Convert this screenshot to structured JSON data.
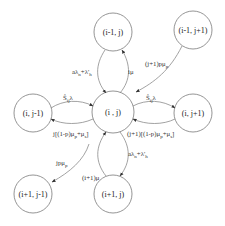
{
  "diagram": {
    "type": "state-transition",
    "nodes": [
      {
        "id": "center",
        "label": "(i , j)",
        "cx": 113,
        "cy": 112,
        "r": 21
      },
      {
        "id": "up",
        "label": "(i-1, j)",
        "cx": 113,
        "cy": 32,
        "r": 19
      },
      {
        "id": "up_right",
        "label": "(i-1, j+1)",
        "cx": 193,
        "cy": 30,
        "r": 19
      },
      {
        "id": "left",
        "label": "(i, j-1)",
        "cx": 33,
        "cy": 113,
        "r": 19
      },
      {
        "id": "right",
        "label": "(i, j+1)",
        "cx": 193,
        "cy": 113,
        "r": 19
      },
      {
        "id": "down_left",
        "label": "(i+1, j-1)",
        "cx": 33,
        "cy": 194,
        "r": 19
      },
      {
        "id": "down",
        "label": "(i+1, j)",
        "cx": 113,
        "cy": 194,
        "r": 19
      }
    ],
    "edges": [
      {
        "from": "up",
        "to": "center",
        "label": "aλn+λ'h",
        "parts": [
          [
            "a",
            ""
          ],
          [
            "λ",
            ""
          ],
          [
            "n",
            "sub"
          ],
          [
            "+λ'",
            ""
          ],
          [
            "h",
            "sub"
          ]
        ]
      },
      {
        "from": "center",
        "to": "up",
        "label": "iμ"
      },
      {
        "from": "up_right",
        "to": "center",
        "label": "(j+1)pμp"
      },
      {
        "from": "left",
        "to": "center",
        "label": "Ŝijλ"
      },
      {
        "from": "center",
        "to": "left",
        "label": "j[(1-p)μp+μs]"
      },
      {
        "from": "center",
        "to": "right",
        "label": "Ŝijλ"
      },
      {
        "from": "right",
        "to": "center",
        "label": "(j+1)[(1-p)μp+μs]"
      },
      {
        "from": "center",
        "to": "down_left",
        "label": "jpμp"
      },
      {
        "from": "down",
        "to": "center",
        "label": "(i+1)μ"
      },
      {
        "from": "center",
        "to": "down",
        "label": "aλn+λ'h"
      }
    ]
  },
  "labels": {
    "node_center": "(i , j)",
    "node_up": "(i-1, j)",
    "node_up_right": "(i-1, j+1)",
    "node_left": "(i, j-1)",
    "node_right": "(i, j+1)",
    "node_down_left": "(i+1, j-1)",
    "node_down": "(i+1, j)",
    "edge_up_to_center": {
      "a": "aλ",
      "b": "n",
      "c": "+λ'",
      "d": "h"
    },
    "edge_center_to_up": "iμ",
    "edge_up_right_to_center": {
      "a": "(j+1)pμ",
      "b": "p"
    },
    "edge_left_to_center": {
      "a": "Ŝ",
      "b": "ij",
      "c": "λ"
    },
    "edge_center_to_left": {
      "a": "j[(1-p)μ",
      "b": "p",
      "c": "+μ",
      "d": "s",
      "e": "]"
    },
    "edge_center_to_right": {
      "a": "Ŝ",
      "b": "ij",
      "c": "λ"
    },
    "edge_right_to_center": {
      "a": "(j+1)[(1-p)μ",
      "b": "p",
      "c": "+μ",
      "d": "s",
      "e": "]"
    },
    "edge_center_to_down_left": {
      "a": "jpμ",
      "b": "p"
    },
    "edge_down_to_center": "(i+1)μ",
    "edge_center_to_down": {
      "a": "aλ",
      "b": "n",
      "c": "+λ'",
      "d": "h"
    }
  },
  "colors": {
    "node_stroke": "#7a7a7a",
    "edge_stroke": "#8a8a8a",
    "text": "#222222",
    "background": "#ffffff"
  }
}
